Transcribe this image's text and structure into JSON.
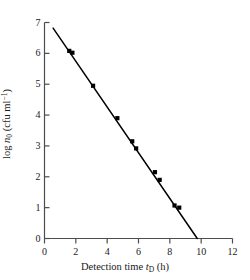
{
  "chart_data": {
    "type": "scatter",
    "title": "",
    "subtitle": "",
    "xlabel_full": "Detection time tD (h)",
    "xlabel_prefix": "Detection time ",
    "xlabel_var": "t",
    "xlabel_var_sub": "D",
    "xlabel_unit": " (h)",
    "ylabel_full": "log n0 (cfu ml-1)",
    "ylabel_prefix": "log ",
    "ylabel_var": "n",
    "ylabel_var_sub": "0",
    "ylabel_unit_open": " (cfu ml",
    "ylabel_unit_sup": "−1",
    "ylabel_unit_close": ")",
    "xlim": [
      0,
      12
    ],
    "ylim": [
      0,
      7
    ],
    "xticks": [
      0,
      2,
      4,
      6,
      8,
      10,
      12
    ],
    "yticks": [
      0,
      1,
      2,
      3,
      4,
      5,
      6,
      7
    ],
    "xtick_labels": [
      "0",
      "2",
      "4",
      "6",
      "8",
      "10",
      "12"
    ],
    "ytick_labels": [
      "0",
      "1",
      "2",
      "3",
      "4",
      "5",
      "6",
      "7"
    ],
    "grid": false,
    "legend": false,
    "legend_position": "none",
    "marker": "filled-square",
    "marker_color": "#000000",
    "line_color": "#000000",
    "axis_color": "#4d4d4d",
    "background_color": "#ffffff",
    "points": [
      {
        "x": 1.58,
        "y": 6.08
      },
      {
        "x": 1.78,
        "y": 6.02
      },
      {
        "x": 3.1,
        "y": 4.95
      },
      {
        "x": 4.65,
        "y": 3.9
      },
      {
        "x": 5.6,
        "y": 3.15
      },
      {
        "x": 5.85,
        "y": 2.92
      },
      {
        "x": 7.05,
        "y": 2.15
      },
      {
        "x": 7.35,
        "y": 1.9
      },
      {
        "x": 8.3,
        "y": 1.07
      },
      {
        "x": 8.6,
        "y": 1.0
      }
    ],
    "fit_line": {
      "x_start": 0.55,
      "y_start": 6.82,
      "x_end": 9.75,
      "y_end": 0.0
    }
  }
}
